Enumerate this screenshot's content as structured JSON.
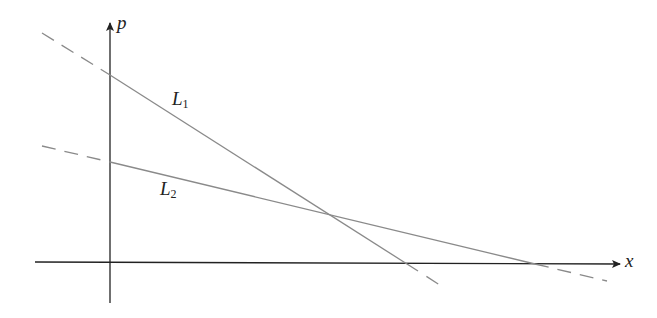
{
  "diagram": {
    "type": "supply-demand-style linear diagram",
    "axes": {
      "x": {
        "label": "x"
      },
      "y": {
        "label": "p"
      }
    },
    "lines": [
      {
        "name": "L",
        "subscript": "1",
        "style": "solid within first quadrant, dashed outside",
        "slope": "steeper"
      },
      {
        "name": "L",
        "subscript": "2",
        "style": "solid within first quadrant, dashed outside",
        "slope": "flatter"
      }
    ],
    "colors": {
      "axes": "#222222",
      "lines": "#8a8a8a",
      "background": "#ffffff"
    }
  }
}
